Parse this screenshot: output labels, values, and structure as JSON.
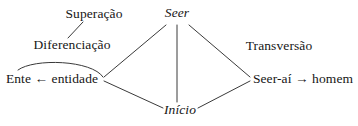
{
  "diagram": {
    "type": "concept-diagram",
    "language": "pt-BR",
    "background_color": "#ffffff",
    "line_color": "#3a3a3a",
    "text_color": "#161616",
    "nodes": [
      {
        "id": "superacao",
        "label": "Superação",
        "style": "roman",
        "x": 94,
        "y": 14
      },
      {
        "id": "seer",
        "label": "Seer",
        "style": "italic",
        "x": 177,
        "y": 13
      },
      {
        "id": "diferenciacao",
        "label": "Diferenciação",
        "style": "roman",
        "x": 72,
        "y": 45
      },
      {
        "id": "transversao",
        "label": "Transversão",
        "style": "roman",
        "x": 279,
        "y": 46
      },
      {
        "id": "ente-entidade",
        "label": "Ente ← entidade",
        "style": "roman",
        "x": 52,
        "y": 79
      },
      {
        "id": "seer-ai-homem",
        "label": "Seer-aí → homem",
        "style": "roman",
        "x": 303,
        "y": 79
      },
      {
        "id": "inicio",
        "label": "Início",
        "style": "italic",
        "x": 180,
        "y": 110
      }
    ],
    "edges": [
      {
        "id": "edge-superacao-diferenciacao",
        "from": "superacao",
        "to": "diferenciacao",
        "kind": "line"
      },
      {
        "id": "edge-seer-left-vertex",
        "from": "seer",
        "to": "left-vertex",
        "kind": "line"
      },
      {
        "id": "edge-seer-inicio",
        "from": "seer",
        "to": "inicio",
        "kind": "line"
      },
      {
        "id": "edge-seer-right-vertex",
        "from": "seer",
        "to": "right-vertex",
        "kind": "line"
      },
      {
        "id": "edge-left-vertex-inicio",
        "from": "left-vertex",
        "to": "inicio",
        "kind": "line"
      },
      {
        "id": "edge-inicio-right-vertex",
        "from": "inicio",
        "to": "right-vertex",
        "kind": "line"
      },
      {
        "id": "edge-entidade-ente-arc",
        "from": "left-vertex",
        "to": "ente",
        "kind": "arc"
      }
    ]
  }
}
